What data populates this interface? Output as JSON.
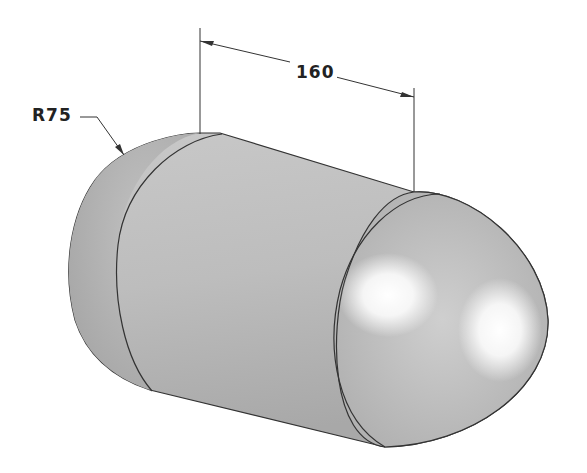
{
  "drawing": {
    "type": "isometric capsule (cylinder with hemispherical ends)",
    "dimensions": {
      "length": "160",
      "radius": "R75"
    },
    "colors": {
      "background": "#ffffff",
      "body_shade": "#b4b4b4",
      "highlight": "#ffffff",
      "outline": "#333333"
    }
  }
}
